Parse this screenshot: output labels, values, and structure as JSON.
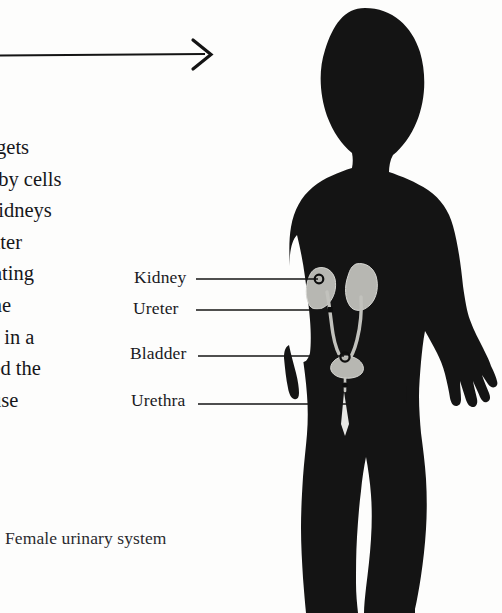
{
  "page": {
    "width": 502,
    "height": 613,
    "background_color": "#fdfdfc",
    "ink_color": "#111111"
  },
  "arrow": {
    "name": "horizontal-arrow",
    "direction": "right",
    "color": "#141414"
  },
  "article": {
    "heading_visible_text": "TEM",
    "heading_note_clipped": true,
    "body_lines": [
      "m gets",
      "e by cells",
      "kidneys",
      "vater",
      "creating",
      "ine",
      "red in a",
      "lled the",
      "use"
    ]
  },
  "caption": {
    "text": "Female urinary system"
  },
  "figure": {
    "silhouette": {
      "name": "child-body-silhouette",
      "fill": "#141414"
    },
    "organs": {
      "fill": "#b9b9b4",
      "outline": "#dedede"
    },
    "marker_color": "#101010",
    "leader_color": "#151515"
  },
  "labels": [
    {
      "id": "kidney",
      "text": "Kidney"
    },
    {
      "id": "ureter",
      "text": "Ureter"
    },
    {
      "id": "bladder",
      "text": "Bladder"
    },
    {
      "id": "urethra",
      "text": "Urethra"
    }
  ]
}
